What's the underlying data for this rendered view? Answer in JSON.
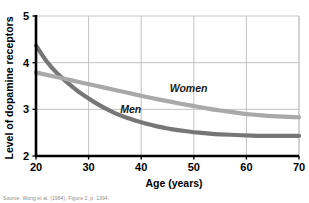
{
  "figure": {
    "source_note": "Source: Wong et al. (1984). Figure 2, p. 1394."
  },
  "chart_data": {
    "type": "line",
    "title": "",
    "xlabel": "Age (years)",
    "ylabel": "Level of dopamine receptors",
    "xlim": [
      20,
      70
    ],
    "ylim": [
      2,
      5
    ],
    "xticks": [
      "20",
      "30",
      "40",
      "50",
      "60",
      "70"
    ],
    "yticks": [
      "2",
      "3",
      "4",
      "5"
    ],
    "xtick_values": [
      20,
      30,
      40,
      50,
      60,
      70
    ],
    "ytick_values": [
      2,
      3,
      4,
      5
    ],
    "grid": true,
    "grid_color": "#b4b4b4",
    "legend": "inline-labels",
    "x": [
      20,
      22,
      24,
      26,
      28,
      30,
      32,
      34,
      36,
      38,
      40,
      42,
      44,
      46,
      48,
      50,
      52,
      54,
      56,
      58,
      60,
      62,
      64,
      66,
      68,
      70
    ],
    "series": [
      {
        "name": "Men",
        "label": "Men",
        "color": "#767676",
        "values": [
          4.37,
          4.02,
          3.77,
          3.57,
          3.38,
          3.23,
          3.09,
          2.97,
          2.87,
          2.79,
          2.72,
          2.66,
          2.61,
          2.57,
          2.54,
          2.51,
          2.49,
          2.47,
          2.46,
          2.45,
          2.44,
          2.43,
          2.43,
          2.43,
          2.43,
          2.43
        ],
        "label_x": 38,
        "label_y": 2.93
      },
      {
        "name": "Women",
        "label": "Women",
        "color": "#a9a9a9",
        "values": [
          3.79,
          3.74,
          3.69,
          3.64,
          3.59,
          3.54,
          3.49,
          3.44,
          3.39,
          3.34,
          3.29,
          3.24,
          3.2,
          3.15,
          3.11,
          3.07,
          3.03,
          2.99,
          2.96,
          2.93,
          2.9,
          2.88,
          2.86,
          2.85,
          2.84,
          2.83
        ],
        "label_x": 49,
        "label_y": 3.38
      }
    ]
  }
}
